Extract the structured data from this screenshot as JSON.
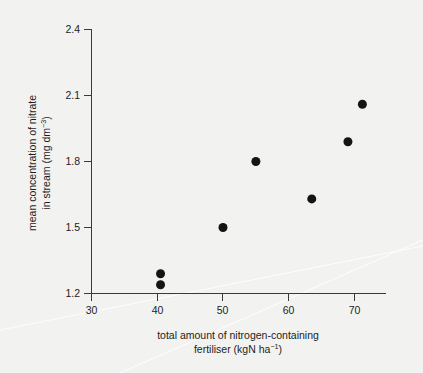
{
  "figure": {
    "background_color": "#f2f2f0",
    "point_color": "#141414",
    "axis_color": "#3a3a3a"
  },
  "chart_data": {
    "type": "scatter",
    "title": "",
    "xlabel_line1": "total amount of nitrogen-containing",
    "xlabel_line2_prefix": "fertiliser (kgN ha",
    "xlabel_line2_sup": "−1",
    "xlabel_line2_suffix": ")",
    "ylabel_line1": "mean concentration of nitrate",
    "ylabel_line2_prefix": "in stream (mg dm",
    "ylabel_line2_sup": "−3",
    "ylabel_line2_suffix": ")",
    "xlim": [
      30,
      74
    ],
    "ylim": [
      1.2,
      2.4
    ],
    "xticks": [
      30,
      40,
      50,
      60,
      70
    ],
    "xtick_labels": [
      "30",
      "40",
      "50",
      "60",
      "70"
    ],
    "yticks": [
      1.2,
      1.5,
      1.8,
      2.1,
      2.4
    ],
    "ytick_labels": [
      "1.2",
      "1.5",
      "1.8",
      "2.1",
      "2.4"
    ],
    "grid": false,
    "legend": null,
    "marker": "filled-circle",
    "marker_size_px": 9,
    "x": [
      40.5,
      40.5,
      50.0,
      55.0,
      63.5,
      69.0,
      71.2
    ],
    "y": [
      1.29,
      1.24,
      1.5,
      1.8,
      1.63,
      1.89,
      2.06
    ],
    "points": [
      {
        "x": 40.5,
        "y": 1.29
      },
      {
        "x": 40.5,
        "y": 1.24
      },
      {
        "x": 50.0,
        "y": 1.5
      },
      {
        "x": 55.0,
        "y": 1.8
      },
      {
        "x": 63.5,
        "y": 1.63
      },
      {
        "x": 69.0,
        "y": 1.89
      },
      {
        "x": 71.2,
        "y": 2.06
      }
    ]
  }
}
